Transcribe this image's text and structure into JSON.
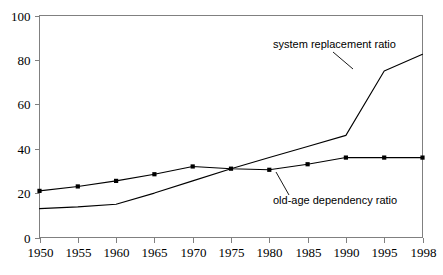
{
  "chart_data": {
    "type": "line",
    "title": "",
    "subtitle": "",
    "xlabel": "",
    "ylabel": "",
    "x": [
      1950,
      1955,
      1960,
      1965,
      1970,
      1975,
      1980,
      1985,
      1990,
      1995,
      1998
    ],
    "categories": [
      "1950",
      "1955",
      "1960",
      "1965",
      "1970",
      "1975",
      "1980",
      "1985",
      "1990",
      "1995",
      "1998"
    ],
    "xtick_labels": [
      "1950",
      "1955",
      "1960",
      "1965",
      "1970",
      "1975",
      "1980",
      "1985",
      "1990",
      "1995",
      "1998"
    ],
    "ytick_labels": [
      "0",
      "20",
      "40",
      "60",
      "80",
      "100"
    ],
    "yticks": [
      0,
      20,
      40,
      60,
      80,
      100
    ],
    "ylim": [
      0,
      100
    ],
    "grid": false,
    "legend": "none",
    "series": [
      {
        "name": "old-age dependency ratio",
        "markers": "square",
        "values": [
          21,
          23,
          25.5,
          28.5,
          32,
          31,
          30.5,
          33,
          36,
          36,
          36
        ]
      },
      {
        "name": "system replacement ratio",
        "markers": "none",
        "values": [
          13,
          13.8,
          15,
          20,
          25.5,
          31,
          36,
          41,
          46,
          75,
          82.5
        ]
      }
    ],
    "annotations": [
      {
        "text": "system replacement ratio",
        "target_x": 1995,
        "target_y": 75
      },
      {
        "text": "old-age dependency ratio",
        "target_x": 1980,
        "target_y": 30.5
      }
    ],
    "colors": {
      "line": "#000000",
      "marker": "#000000",
      "axis": "#808080",
      "background": "#ffffff",
      "text": "#000000"
    }
  }
}
